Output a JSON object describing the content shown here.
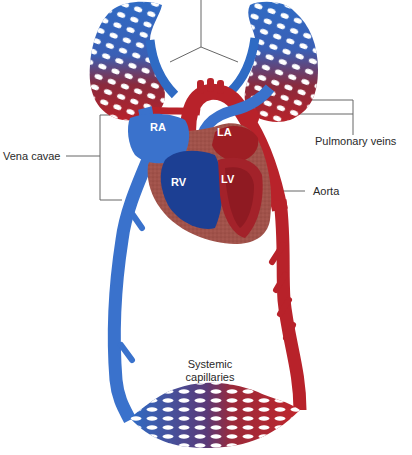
{
  "diagram": {
    "colors": {
      "oxygenated": "#b8222a",
      "deoxygenated": "#2f6bc4",
      "deoxygenated_dark": "#1c3f93",
      "heart_muscle": "#a0524a",
      "leader_line": "#555555",
      "background": "#ffffff"
    },
    "chamber_labels": {
      "ra": "RA",
      "la": "LA",
      "rv": "RV",
      "lv": "LV"
    },
    "callouts": {
      "vena_cavae": "Vena cavae",
      "pulmonary_veins": "Pulmonary veins",
      "aorta": "Aorta",
      "systemic_capillaries_line1": "Systemic",
      "systemic_capillaries_line2": "capillaries"
    }
  }
}
